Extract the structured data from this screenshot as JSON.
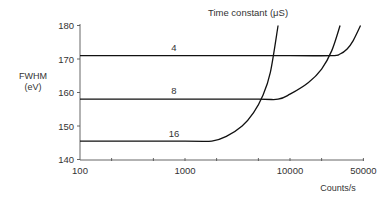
{
  "chart_data": {
    "type": "line",
    "title": "Time constant (μS)",
    "xlabel": "Counts/s",
    "ylabel": "FWHM (eV)",
    "ylabel_lines": [
      "FWHM",
      "(eV)"
    ],
    "xscale": "log",
    "xlim": [
      100,
      50000
    ],
    "ylim": [
      140,
      180
    ],
    "grid": false,
    "legend": "inline labels on curves",
    "x_ticks": [
      100,
      1000,
      10000,
      50000
    ],
    "x_tick_labels": [
      "100",
      "1000",
      "10000",
      "50000"
    ],
    "y_ticks": [
      140,
      150,
      160,
      170,
      180
    ],
    "y_tick_labels": [
      "140",
      "150",
      "160",
      "170",
      "180"
    ],
    "series": [
      {
        "name": "4",
        "x": [
          100,
          1000,
          10000,
          25000,
          30000,
          35000,
          40000,
          47000
        ],
        "y": [
          171,
          171,
          171,
          171,
          171.5,
          173,
          175.5,
          180
        ]
      },
      {
        "name": "8",
        "x": [
          100,
          1000,
          5000,
          7700,
          10000,
          15000,
          20000,
          25000,
          30000
        ],
        "y": [
          158,
          158,
          158,
          158,
          159.5,
          163,
          167,
          172.5,
          180
        ]
      },
      {
        "name": "16",
        "x": [
          100,
          1000,
          1800,
          2500,
          3500,
          4500,
          5500,
          6500,
          7700
        ],
        "y": [
          145.5,
          145.5,
          145.5,
          147,
          150,
          154,
          159,
          166,
          180
        ]
      }
    ]
  }
}
